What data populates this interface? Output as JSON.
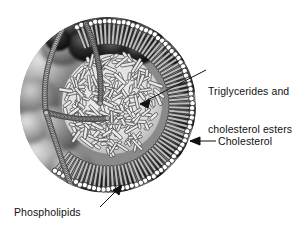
{
  "figure": {
    "background_color": "#ffffff",
    "width": 303,
    "height": 234
  },
  "labels": {
    "triglycerides": {
      "line1": "Triglycerides and",
      "line2": "cholesterol esters",
      "target": "core",
      "color": "#111111"
    },
    "cholesterol": {
      "text": "Cholesterol",
      "target": "membrane-dark-blob-right",
      "color": "#111111"
    },
    "phospholipids": {
      "text": "Phospholipids",
      "target": "membrane-head-group-bottom",
      "color": "#111111"
    }
  },
  "structures": {
    "core_label": "triglyceride and cholesterol ester needles",
    "monolayer_label": "phospholipid monolayer",
    "blob_label": "cholesterol molecule",
    "colors": {
      "core_fill": "#e9e9e9",
      "core_stroke": "#3a3a3a",
      "head_group": "#ffffff",
      "head_outline": "#2b2b2b",
      "tail": "#bdbdbd",
      "tail_outline": "#333333",
      "blob_dark": "#141414",
      "blob_mid": "#7b7b7b",
      "blob_light": "#b9b9b9",
      "leader_line": "#111111"
    }
  }
}
